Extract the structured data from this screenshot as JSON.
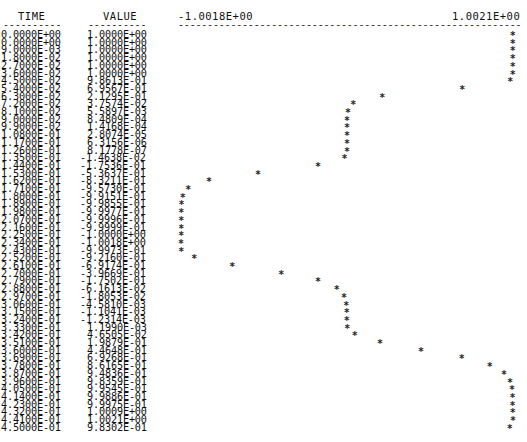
{
  "chart_data": {
    "type": "scatter",
    "title": "",
    "columns": {
      "time_header": "TIME",
      "value_header": "VALUE"
    },
    "axis": {
      "min_label": "-1.0018E+00",
      "max_label": "1.0021E+00",
      "min": -1.0018,
      "max": 1.0021
    },
    "marker": "*",
    "time": [
      "0.0000E+00",
      "0.0000E+00",
      "9.0000E-03",
      "1.8000E-02",
      "2.7000E-02",
      "3.6000E-02",
      "4.5000E-02",
      "5.4000E-02",
      "6.3000E-02",
      "7.2000E-02",
      "8.1000E-02",
      "9.0000E-02",
      "9.9000E-02",
      "1.0800E-01",
      "1.1700E-01",
      "1.2600E-01",
      "1.3500E-01",
      "1.4400E-01",
      "1.5300E-01",
      "1.6200E-01",
      "1.7100E-01",
      "1.8000E-01",
      "1.8900E-01",
      "1.9800E-01",
      "2.0700E-01",
      "2.1600E-01",
      "2.2500E-01",
      "2.3400E-01",
      "2.4300E-01",
      "2.5200E-01",
      "2.6100E-01",
      "2.7000E-01",
      "2.7900E-01",
      "2.8800E-01",
      "2.9700E-01",
      "3.0600E-01",
      "3.1500E-01",
      "3.2400E-01",
      "3.3300E-01",
      "3.4200E-01",
      "3.5100E-01",
      "3.6000E-01",
      "3.6900E-01",
      "3.7800E-01",
      "3.8700E-01",
      "3.9600E-01",
      "4.0500E-01",
      "4.1400E-01",
      "4.2300E-01",
      "4.3200E-01",
      "4.4100E-01",
      "4.5000E-01"
    ],
    "value": [
      "1.0000E+00",
      "1.0000E+00",
      "1.0000E+00",
      "1.0000E+00",
      "1.0000E+00",
      "1.0000E+00",
      "9.8613E-01",
      "6.9567E-01",
      "2.1295E-01",
      "3.7574E-02",
      "5.5897E-03",
      "8.4809E-04",
      "1.4168E-04",
      "2.8074E-05",
      "6.3156E-06",
      "8.1778E-07",
      "-1.4638E-02",
      "-1.7536E-01",
      "-5.3637E-01",
      "-8.3211E-01",
      "-9.5730E-01",
      "-9.9151E-01",
      "-9.9855E-01",
      "-9.9977E-01",
      "-9.9996E-01",
      "-9.9999E-01",
      "-1.0000E+00",
      "-1.0018E+00",
      "-9.9973E-01",
      "-9.2160E-01",
      "-6.9174E-01",
      "-3.9669E-01",
      "-1.7502E-01",
      "-6.1613E-02",
      "-1.8053E-02",
      "-4.5810E-03",
      "-1.1041E-03",
      "-1.2314E-03",
      "1.1990E-03",
      "4.6505E-02",
      "1.9879E-01",
      "4.4648E-01",
      "6.9268E-01",
      "8.6165E-01",
      "9.4836E-01",
      "9.8359E-01",
      "9.9545E-01",
      "9.9886E-01",
      "9.9975E-01",
      "1.0009E+00",
      "1.0021E+00",
      "9.8302E-01"
    ]
  }
}
